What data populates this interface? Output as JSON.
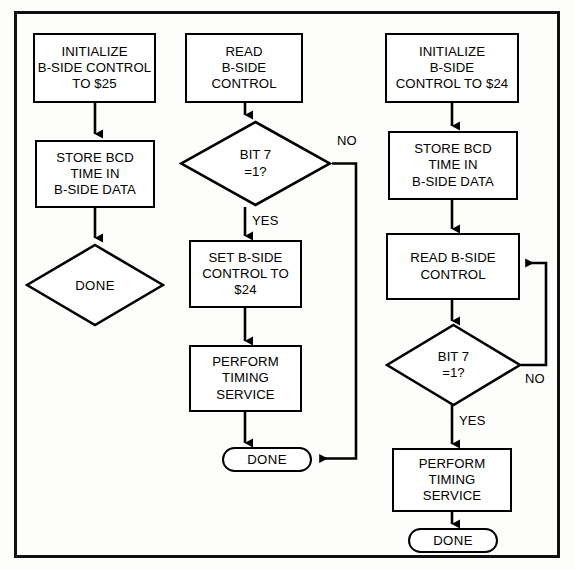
{
  "figure": {
    "border_color": "#111111",
    "line_color": "#000000",
    "background": "#ffffff"
  },
  "flowcharts": [
    {
      "id": "column-1",
      "name": "Set B-Side Control To $25",
      "nodes": [
        {
          "id": "c1-n1",
          "type": "process",
          "lines": [
            "INITIALIZE",
            "B-SIDE CONTROL",
            "TO $25"
          ]
        },
        {
          "id": "c1-n2",
          "type": "process",
          "lines": [
            "STORE BCD",
            "TIME IN",
            "B-SIDE DATA"
          ]
        },
        {
          "id": "c1-n3",
          "type": "diamond-terminal",
          "lines": [
            "DONE"
          ]
        }
      ],
      "edge_labels": []
    },
    {
      "id": "column-2",
      "name": "Read B-Side Control And Service",
      "nodes": [
        {
          "id": "c2-n1",
          "type": "process",
          "lines": [
            "READ",
            "B-SIDE",
            "CONTROL"
          ]
        },
        {
          "id": "c2-n2",
          "type": "decision",
          "lines": [
            "BIT 7",
            "=1?"
          ]
        },
        {
          "id": "c2-n3",
          "type": "process",
          "lines": [
            "SET B-SIDE",
            "CONTROL TO",
            "$24"
          ]
        },
        {
          "id": "c2-n4",
          "type": "process",
          "lines": [
            "PERFORM",
            "TIMING",
            "SERVICE"
          ]
        },
        {
          "id": "c2-n5",
          "type": "terminal",
          "lines": [
            "DONE"
          ]
        }
      ],
      "edge_labels": [
        {
          "id": "c2-no",
          "text": "NO"
        },
        {
          "id": "c2-yes",
          "text": "YES"
        }
      ]
    },
    {
      "id": "column-3",
      "name": "Initialize To $24 And Poll",
      "nodes": [
        {
          "id": "c3-n1",
          "type": "process",
          "lines": [
            "INITIALIZE",
            "B-SIDE",
            "CONTROL TO $24"
          ]
        },
        {
          "id": "c3-n2",
          "type": "process",
          "lines": [
            "STORE BCD",
            "TIME IN",
            "B-SIDE DATA"
          ]
        },
        {
          "id": "c3-n3",
          "type": "process",
          "lines": [
            "READ B-SIDE",
            "CONTROL"
          ]
        },
        {
          "id": "c3-n4",
          "type": "decision",
          "lines": [
            "BIT 7",
            "=1?"
          ]
        },
        {
          "id": "c3-n5",
          "type": "process",
          "lines": [
            "PERFORM",
            "TIMING",
            "SERVICE"
          ]
        },
        {
          "id": "c3-n6",
          "type": "terminal",
          "lines": [
            "DONE"
          ]
        }
      ],
      "edge_labels": [
        {
          "id": "c3-no",
          "text": "NO"
        },
        {
          "id": "c3-yes",
          "text": "YES"
        }
      ]
    }
  ]
}
